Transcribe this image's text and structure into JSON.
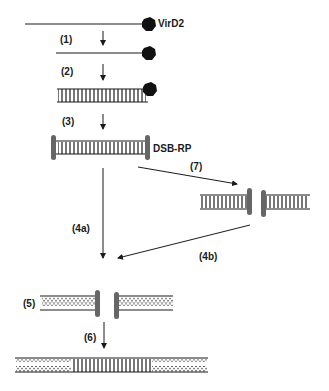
{
  "diagram": {
    "type": "molecular-pathway",
    "colors": {
      "line": "#1a1a1a",
      "cap": "#666666",
      "protein": "#111111",
      "background": "#ffffff"
    },
    "labels": {
      "virD2": "VirD2",
      "dsb_rp": "DSB-RP",
      "step1": "(1)",
      "step2": "(2)",
      "step3": "(3)",
      "step4a": "(4a)",
      "step4b": "(4b)",
      "step5": "(5)",
      "step6": "(6)",
      "step7": "(7)"
    },
    "stages": [
      {
        "id": "ssT-strand",
        "description": "single-stranded DNA with VirD2"
      },
      {
        "id": "ssT-strand-2",
        "description": "single-stranded DNA with VirD2"
      },
      {
        "id": "dsT-DNA",
        "description": "double-stranded DNA with VirD2"
      },
      {
        "id": "dsT-DNA-capped",
        "description": "double-stranded DNA with DSB-RP ends"
      },
      {
        "id": "broken-dsDNA",
        "description": "double-strand break with repair proteins"
      },
      {
        "id": "host-break",
        "description": "host DNA with break and repair proteins"
      },
      {
        "id": "integrated",
        "description": "T-DNA integrated into host DNA"
      }
    ]
  }
}
